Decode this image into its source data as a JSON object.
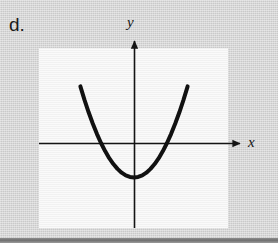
{
  "figure": {
    "part_label": "d.",
    "background_color": "#d2d2d2",
    "panel_color": "#f4f4f4",
    "ink_color": "#111111",
    "bottom_rule_color": "#6f6f6f"
  },
  "axes": {
    "x_label": "x",
    "y_label": "y",
    "x_axis_y_px": 143,
    "y_axis_x_px": 134,
    "x_arrow_tip_px": 243,
    "y_arrow_tip_px": 38,
    "show_ticks": false,
    "show_tick_labels": false,
    "show_grid": false
  },
  "panel": {
    "left_px": 39,
    "top_px": 48,
    "width_px": 189,
    "height_px": 180
  },
  "chart_data": {
    "type": "line",
    "title": "",
    "subtitle": "",
    "xlabel": "x",
    "ylabel": "y",
    "legend": [],
    "legend_position": "none",
    "grid": false,
    "axis_style": "arrow-axes-through-origin",
    "xlim": [
      -4.75,
      4.7
    ],
    "ylim": [
      -3.5,
      2.4
    ],
    "annotations": [],
    "series": [
      {
        "name": "parabola",
        "shape": "upward-opening parabola",
        "equation": "y = 0.5 x^2 - 2",
        "vertex": [
          0,
          -2
        ],
        "opens": "up",
        "x_intercepts": [
          -2,
          2
        ],
        "y_intercept": -2,
        "stroke_color": "#111111",
        "stroke_width_px": 4,
        "x": [
          -3.25,
          -3.0,
          -2.75,
          -2.5,
          -2.25,
          -2.0,
          -1.75,
          -1.5,
          -1.25,
          -1.0,
          -0.75,
          -0.5,
          -0.25,
          0,
          0.25,
          0.5,
          0.75,
          1.0,
          1.25,
          1.5,
          1.75,
          2.0,
          2.25,
          2.5,
          2.75,
          3.0,
          3.25
        ],
        "values": [
          3.28,
          2.5,
          1.78,
          1.13,
          0.53,
          0,
          -0.47,
          -0.88,
          -1.22,
          -1.5,
          -1.72,
          -1.88,
          -1.97,
          -2.0,
          -1.97,
          -1.88,
          -1.72,
          -1.5,
          -1.22,
          -0.88,
          -0.47,
          0,
          0.53,
          1.13,
          1.78,
          2.5,
          3.28
        ]
      }
    ]
  }
}
